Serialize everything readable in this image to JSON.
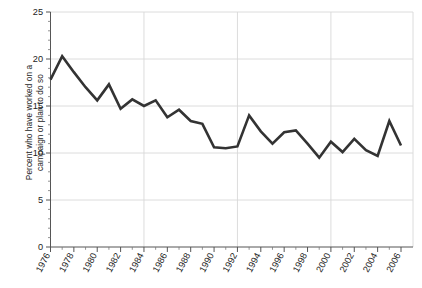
{
  "chart_data": {
    "type": "line",
    "title": "",
    "subtitle": "",
    "xlabel": "",
    "ylabel": "Percent who have worked on a\ncampaign or plan to do so",
    "ylabel_line1": "Percent who have worked on a",
    "ylabel_line2": "campaign or plan to do so",
    "xlim": [
      1976,
      2006
    ],
    "ylim": [
      0,
      25
    ],
    "yticks": [
      0,
      5,
      10,
      15,
      20,
      25
    ],
    "ytick_labels": [
      "0",
      "5",
      "10",
      "15",
      "20",
      "25"
    ],
    "xticks": [
      1976,
      1978,
      1980,
      1982,
      1984,
      1986,
      1988,
      1990,
      1992,
      1994,
      1996,
      1998,
      2000,
      2002,
      2004,
      2006
    ],
    "xtick_labels": [
      "1976",
      "1978",
      "1980",
      "1982",
      "1984",
      "1986",
      "1988",
      "1990",
      "1992",
      "1994",
      "1996",
      "1998",
      "2000",
      "2002",
      "2004",
      "2006"
    ],
    "x_minor_tick_interval": 1,
    "grid": {
      "horizontal": true,
      "vertical": true,
      "horizontal_at": [
        5,
        10,
        15,
        20,
        25
      ],
      "vertical_at": [
        1984,
        1992,
        2000,
        2006
      ],
      "color": "#d8d8d8"
    },
    "legend": {
      "visible": false,
      "position": "none",
      "entries": []
    },
    "annotations": [],
    "series": [
      {
        "name": "Percent who have worked on a campaign or plan to do so",
        "color": "#333333",
        "line_width": 2.6,
        "markers": false,
        "x": [
          1976,
          1977,
          1978,
          1979,
          1980,
          1981,
          1982,
          1983,
          1984,
          1985,
          1986,
          1987,
          1988,
          1989,
          1990,
          1991,
          1992,
          1993,
          1994,
          1995,
          1996,
          1997,
          1998,
          1999,
          2000,
          2001,
          2002,
          2003,
          2004,
          2005,
          2006
        ],
        "values": [
          17.8,
          20.3,
          18.6,
          17.0,
          15.6,
          17.3,
          14.7,
          15.7,
          15.0,
          15.6,
          13.8,
          14.6,
          13.4,
          13.1,
          10.6,
          10.5,
          10.7,
          14.0,
          12.3,
          11.0,
          12.2,
          12.4,
          11.0,
          9.5,
          11.2,
          10.1,
          11.5,
          10.3,
          9.7,
          13.4,
          10.8
        ]
      }
    ]
  },
  "axes": {
    "y_axis_name": "percent-axis",
    "x_axis_name": "year-axis"
  }
}
